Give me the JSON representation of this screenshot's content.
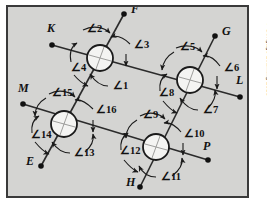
{
  "figure": {
    "background_color": "#d4d4d2",
    "border_color": "#3a3a3a",
    "line_color": "#2b2b2b",
    "label_color": "#1a1a1a",
    "credit": "© Cengage Learning 2013"
  },
  "points": [
    {
      "label": "K",
      "dot_x": 52,
      "dot_y": 45,
      "label_x": 47,
      "label_y": 32
    },
    {
      "label": "F",
      "dot_x": 124,
      "dot_y": 14,
      "label_x": 131,
      "label_y": 13
    },
    {
      "label": "G",
      "dot_x": 215,
      "dot_y": 36,
      "label_x": 222,
      "label_y": 35
    },
    {
      "label": "L",
      "dot_x": 240,
      "dot_y": 97,
      "label_x": 236,
      "label_y": 84
    },
    {
      "label": "M",
      "dot_x": 23,
      "dot_y": 104,
      "label_x": 18,
      "label_y": 92
    },
    {
      "label": "E",
      "dot_x": 41,
      "dot_y": 166,
      "label_x": 26,
      "label_y": 165
    },
    {
      "label": "H",
      "dot_x": 140,
      "dot_y": 187,
      "label_x": 126,
      "label_y": 186
    },
    {
      "label": "P",
      "dot_x": 208,
      "dot_y": 160,
      "label_x": 203,
      "label_y": 150
    }
  ],
  "intersections": [
    {
      "name": "top-left",
      "cx": 100,
      "cy": 58,
      "r": 13,
      "angles": [
        1,
        2,
        3,
        4
      ]
    },
    {
      "name": "top-right",
      "cx": 190,
      "cy": 80,
      "r": 13,
      "angles": [
        5,
        6,
        7,
        8
      ]
    },
    {
      "name": "bottom-left",
      "cx": 64,
      "cy": 124,
      "r": 13,
      "angles": [
        13,
        14,
        15,
        16
      ]
    },
    {
      "name": "bottom-right",
      "cx": 156,
      "cy": 147,
      "r": 13,
      "angles": [
        9,
        10,
        11,
        12
      ]
    }
  ],
  "lines": [
    {
      "name": "line-K-L",
      "from": "K",
      "to": "L"
    },
    {
      "name": "line-M-P",
      "from": "M",
      "to": "P"
    },
    {
      "name": "line-F-E",
      "from": "F",
      "to": "E"
    },
    {
      "name": "line-G-H",
      "from": "G",
      "to": "H"
    }
  ],
  "angle_labels": [
    {
      "id": 1,
      "text": "∠1",
      "x": 113,
      "y": 89
    },
    {
      "id": 2,
      "text": "∠2",
      "x": 87,
      "y": 32
    },
    {
      "id": 3,
      "text": "∠3",
      "x": 134,
      "y": 48
    },
    {
      "id": 4,
      "text": "∠4",
      "x": 71,
      "y": 71
    },
    {
      "id": 5,
      "text": "∠5",
      "x": 180,
      "y": 50
    },
    {
      "id": 6,
      "text": "∠6",
      "x": 224,
      "y": 71
    },
    {
      "id": 7,
      "text": "∠7",
      "x": 203,
      "y": 113
    },
    {
      "id": 8,
      "text": "∠8",
      "x": 159,
      "y": 96
    },
    {
      "id": 9,
      "text": "∠9",
      "x": 143,
      "y": 118
    },
    {
      "id": 10,
      "text": "∠10",
      "x": 184,
      "y": 137
    },
    {
      "id": 11,
      "text": "∠11",
      "x": 161,
      "y": 180
    },
    {
      "id": 12,
      "text": "∠12",
      "x": 120,
      "y": 154
    },
    {
      "id": 13,
      "text": "∠13",
      "x": 74,
      "y": 156
    },
    {
      "id": 14,
      "text": "∠14",
      "x": 31,
      "y": 138
    },
    {
      "id": 15,
      "text": "∠15",
      "x": 52,
      "y": 96
    },
    {
      "id": 16,
      "text": "∠16",
      "x": 96,
      "y": 113
    }
  ]
}
